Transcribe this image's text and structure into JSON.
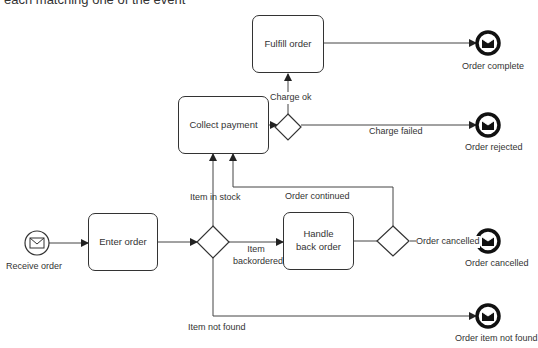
{
  "caption": "each matching one of the event",
  "start_event": {
    "label": "Receive order",
    "icon": "envelope-icon"
  },
  "tasks": {
    "enter_order": "Enter order",
    "collect_payment": "Collect payment",
    "fulfill_order": "Fulfill order",
    "handle_back_order": "Handle back order"
  },
  "end_events": {
    "order_complete": "Order complete",
    "order_rejected": "Order rejected",
    "order_cancelled": "Order cancelled",
    "order_item_not_found": "Order item not found"
  },
  "flows": {
    "charge_ok": "Charge ok",
    "charge_failed": "Charge failed",
    "item_in_stock": "Item in stock",
    "order_continued": "Order continued",
    "item_backordered": "Item backordered",
    "order_cancelled": "Order cancelled",
    "item_not_found": "Item not found"
  },
  "colors": {
    "stroke": "#333333",
    "end_event": "#111111",
    "background": "#ffffff"
  }
}
